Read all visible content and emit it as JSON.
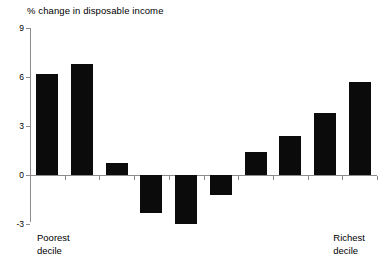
{
  "chart_data": {
    "type": "bar",
    "title": "% change in disposable income",
    "xlabel": "",
    "ylabel": "",
    "ylim": [
      -3,
      9
    ],
    "yticks": [
      9,
      6,
      3,
      0,
      -3
    ],
    "ytick_labels": [
      "9",
      "6",
      "3",
      "0",
      "-3"
    ],
    "grid": false,
    "legend": false,
    "categories": [
      "1",
      "2",
      "3",
      "4",
      "5",
      "6",
      "7",
      "8",
      "9",
      "10"
    ],
    "category_labels": {
      "first": {
        "line1": "Poorest",
        "line2": "decile"
      },
      "last": {
        "line1": "Richest",
        "line2": "decile"
      }
    },
    "values": [
      6.2,
      6.8,
      0.75,
      -2.3,
      -3.0,
      -1.2,
      1.4,
      2.4,
      3.8,
      5.7
    ],
    "bar_color": "#0b0b0b",
    "axis_color": "#8c8c8c",
    "background_color": "#ffffff"
  }
}
